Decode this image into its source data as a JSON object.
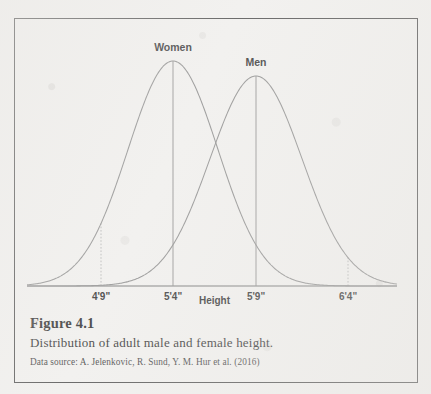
{
  "page": {
    "ghost_text_top": "",
    "background_color": "#f1f0ee",
    "frame_color": "#4a4a4a"
  },
  "figure": {
    "number_label": "Figure 4.1",
    "caption": "Distribution of adult male and female height.",
    "source": "Data source: A. Jelenkovic, R. Sund, Y. M. Hur et al. (2016)"
  },
  "chart_data": {
    "type": "line",
    "title": "",
    "xlabel": "Height",
    "ylabel": "",
    "grid": false,
    "legend_position": "inline-curve-labels",
    "axis_baseline_only": true,
    "xtick_labels": [
      "4'9\"",
      "5'4\"",
      "5'9\"",
      "6'4\""
    ],
    "xtick_positions_px": [
      100,
      172,
      255,
      347
    ],
    "series": [
      {
        "name": "Women",
        "label": "Women",
        "mean_label": "5'4\"",
        "mean_px": 172,
        "peak_height_px": 225,
        "sd_px": 45,
        "color": "#8b8b8b",
        "mean_line": true,
        "sd_marker_label": "4'9\"",
        "sd_marker_px": 100
      },
      {
        "name": "Men",
        "label": "Men",
        "mean_label": "5'9\"",
        "mean_px": 255,
        "peak_height_px": 210,
        "sd_px": 46,
        "color": "#8b8b8b",
        "mean_line": true,
        "sd_marker_label": "6'4\"",
        "sd_marker_px": 347
      }
    ],
    "annotations": [
      {
        "text": "Women",
        "x_px": 172,
        "y_px": 44
      },
      {
        "text": "Men",
        "x_px": 255,
        "y_px": 44
      }
    ],
    "curve_intersection_px": {
      "x": 213,
      "y": 152
    },
    "baseline": {
      "y_px": 285,
      "x_start_px": 26,
      "x_end_px": 396
    }
  }
}
